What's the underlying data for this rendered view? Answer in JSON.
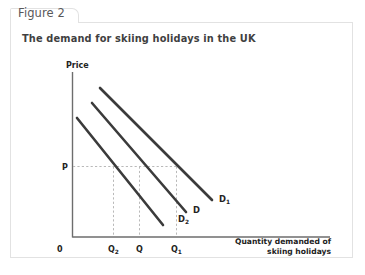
{
  "figure": {
    "tab_label": "Figure 2",
    "subtitle": "The demand for skiing holidays in the UK"
  },
  "chart_data": {
    "type": "line",
    "title": "The demand for skiing holidays in the UK",
    "xlabel_line1": "Quantity demanded of",
    "xlabel_line2": "skiing holidays",
    "ylabel": "Price",
    "origin_label": "0",
    "grid": false,
    "legend": "inline-curve-labels",
    "x_tick_labels": [
      "0",
      "Q",
      "Q",
      "Q"
    ],
    "x_tick_subscripts": [
      "",
      "2",
      "",
      "1"
    ],
    "y_tick_labels": [
      "P"
    ],
    "price_level": "P",
    "annotations": [
      "Horizontal dashed line at price P",
      "Vertical dashed lines dropping from each curve at price P to Q2, Q and Q1"
    ],
    "series": [
      {
        "name": "D",
        "name_base": "D",
        "name_subscript": "2",
        "label": "D2",
        "description": "leftmost demand curve (decrease in demand)",
        "x": [
          0.06,
          0.72
        ],
        "y": [
          0.93,
          0.07
        ],
        "quantity_at_P": "Q2"
      },
      {
        "name": "D",
        "name_base": "D",
        "name_subscript": "",
        "label": "D",
        "description": "original demand curve",
        "x": [
          0.2,
          0.92
        ],
        "y": [
          1.02,
          0.17
        ],
        "quantity_at_P": "Q"
      },
      {
        "name": "D",
        "name_base": "D",
        "name_subscript": "1",
        "label": "D1",
        "description": "rightmost demand curve (increase in demand)",
        "x": [
          0.28,
          1.12
        ],
        "y": [
          1.12,
          0.26
        ],
        "quantity_at_P": "Q1"
      }
    ],
    "colors": {
      "curve": "#3b3b3b",
      "axis": "#6d6d6d",
      "guide": "#b9b9b9",
      "border": "#e2e2e2",
      "text": "#232323",
      "tab_text": "#58585a",
      "background": "#ffffff"
    }
  }
}
